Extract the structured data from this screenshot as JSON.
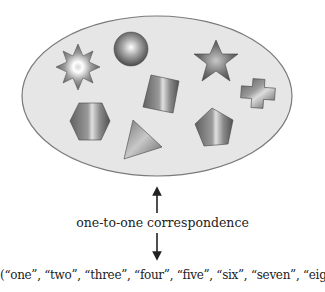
{
  "diagram": {
    "set_container": {
      "shape": "ellipse",
      "fill": "#e6e6e6",
      "stroke": "#7a7a7a"
    },
    "shapes": [
      {
        "name": "eight-point-star",
        "count_index": 1
      },
      {
        "name": "sphere",
        "count_index": 2
      },
      {
        "name": "five-point-star",
        "count_index": 3
      },
      {
        "name": "cube",
        "count_index": 4
      },
      {
        "name": "cross",
        "count_index": 5
      },
      {
        "name": "hexagon",
        "count_index": 6
      },
      {
        "name": "triangle",
        "count_index": 7
      },
      {
        "name": "pentagon",
        "count_index": 8
      }
    ],
    "arrow": {
      "direction": "bidirectional",
      "color": "#222222"
    },
    "correspondence_label": "one-to-one correspondence",
    "words_label": "(“one”, “two”, “three”, “four”, “five”, “six”, “seven”, “eight”)",
    "words": [
      "one",
      "two",
      "three",
      "four",
      "five",
      "six",
      "seven",
      "eight"
    ]
  }
}
